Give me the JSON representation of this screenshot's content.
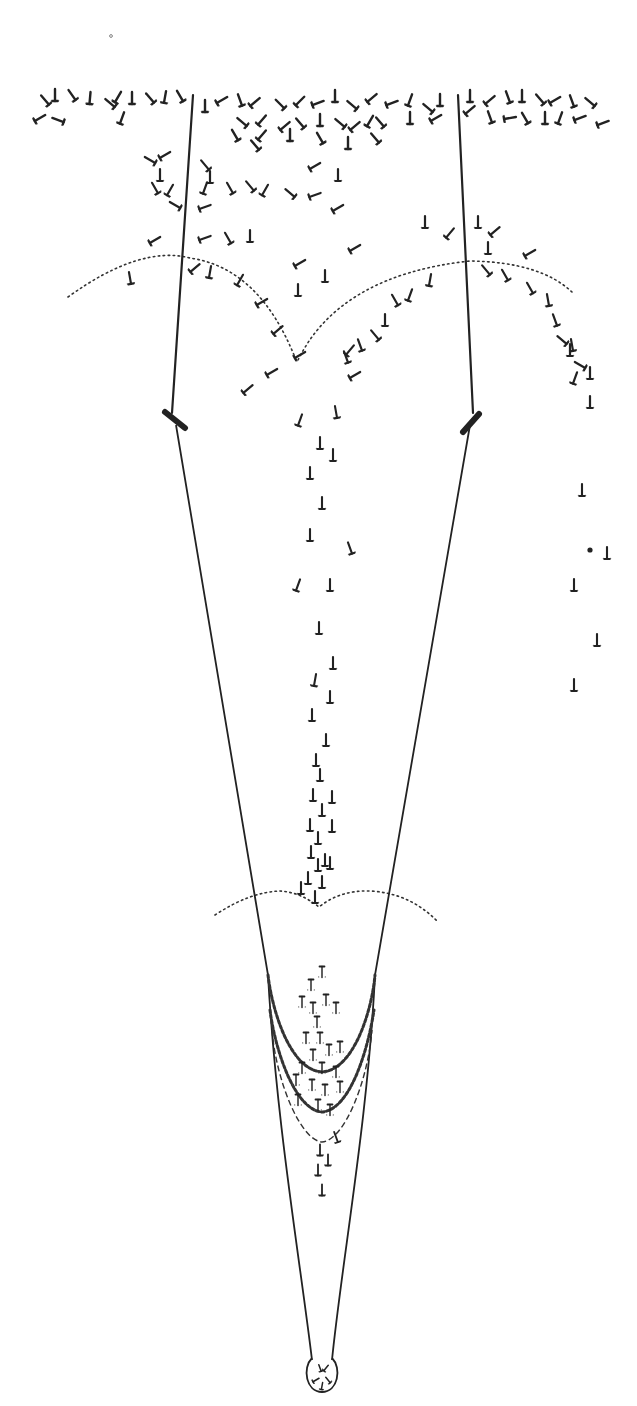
{
  "figure": {
    "type": "scientific-illustration",
    "colors": {
      "ink": "#222222",
      "background": "#ffffff"
    },
    "stray_mark": {
      "x": 111,
      "y": 36
    },
    "wires": [
      {
        "name": "left-wire",
        "from": [
          193,
          95
        ],
        "to": [
          172,
          413
        ]
      },
      {
        "name": "right-wire",
        "from": [
          458,
          95
        ],
        "to": [
          473,
          413
        ]
      }
    ],
    "clips": [
      {
        "name": "left-clip",
        "from": [
          165,
          412
        ],
        "to": [
          185,
          428
        ]
      },
      {
        "name": "right-clip",
        "from": [
          463,
          432
        ],
        "to": [
          479,
          414
        ]
      }
    ],
    "funnel": {
      "left": "M176,425 L268,975 C276,1120 300,1260 312,1360",
      "right": "M470,425 L375,975 C368,1120 342,1260 332,1360",
      "bulb": "M312,1358 C302,1368 306,1392 322,1392 C338,1392 342,1368 332,1358"
    },
    "dotted_arcs": [
      {
        "name": "upper-left-arc",
        "d": "M68,297 Q140,245 190,258 Q260,268 296,360"
      },
      {
        "name": "upper-right-arc",
        "d": "M298,360 Q340,275 470,261 Q540,262 572,292"
      },
      {
        "name": "lower-arc",
        "d": "M215,915 Q250,892 280,891 Q300,892 319,907 Q340,890 370,891 Q410,893 438,922"
      }
    ],
    "chains": [
      {
        "name": "upper-chain",
        "d": "M268,975 C272,1010 290,1070 322,1072 C354,1070 372,1010 375,975",
        "style": "chain"
      },
      {
        "name": "lower-chain",
        "d": "M270,1010 C275,1050 295,1110 322,1112 C350,1110 368,1050 374,1010",
        "style": "chain"
      },
      {
        "name": "inner-thin-line",
        "d": "M272,1030 C276,1080 300,1140 322,1142 C345,1140 368,1080 372,1030",
        "style": "chain-thin"
      }
    ],
    "particle_groups": [
      {
        "name": "top-band",
        "size": 12,
        "width": 2.4,
        "items": [
          [
            45,
            100,
            -40
          ],
          [
            55,
            95,
            0
          ],
          [
            72,
            95,
            -35
          ],
          [
            90,
            98,
            5
          ],
          [
            110,
            103,
            -50
          ],
          [
            118,
            97,
            30
          ],
          [
            132,
            98,
            0
          ],
          [
            150,
            98,
            -40
          ],
          [
            165,
            97,
            10
          ],
          [
            180,
            96,
            -30
          ],
          [
            40,
            118,
            60
          ],
          [
            58,
            120,
            -70
          ],
          [
            122,
            118,
            20
          ],
          [
            205,
            106,
            0
          ],
          [
            222,
            100,
            60
          ],
          [
            240,
            100,
            -20
          ],
          [
            255,
            102,
            50
          ],
          [
            280,
            104,
            -45
          ],
          [
            300,
            101,
            45
          ],
          [
            318,
            103,
            70
          ],
          [
            335,
            96,
            0
          ],
          [
            352,
            105,
            -50
          ],
          [
            372,
            98,
            50
          ],
          [
            392,
            103,
            70
          ],
          [
            410,
            100,
            20
          ],
          [
            428,
            108,
            -50
          ],
          [
            440,
            100,
            0
          ],
          [
            470,
            96,
            0
          ],
          [
            490,
            100,
            50
          ],
          [
            508,
            97,
            -20
          ],
          [
            522,
            96,
            0
          ],
          [
            540,
            99,
            -40
          ],
          [
            555,
            100,
            60
          ],
          [
            572,
            101,
            -20
          ],
          [
            590,
            102,
            -50
          ],
          [
            603,
            123,
            70
          ],
          [
            242,
            122,
            -50
          ],
          [
            262,
            120,
            40
          ],
          [
            285,
            126,
            50
          ],
          [
            300,
            123,
            -40
          ],
          [
            320,
            120,
            0
          ],
          [
            340,
            123,
            -50
          ],
          [
            355,
            126,
            50
          ],
          [
            370,
            121,
            30
          ],
          [
            380,
            122,
            -40
          ],
          [
            410,
            118,
            0
          ],
          [
            436,
            118,
            60
          ],
          [
            470,
            110,
            50
          ],
          [
            490,
            117,
            -20
          ],
          [
            510,
            118,
            80
          ],
          [
            525,
            118,
            -30
          ],
          [
            545,
            118,
            0
          ],
          [
            560,
            118,
            20
          ],
          [
            580,
            118,
            70
          ],
          [
            235,
            135,
            -30
          ],
          [
            262,
            135,
            40
          ],
          [
            290,
            135,
            0
          ],
          [
            320,
            138,
            -30
          ],
          [
            375,
            138,
            -40
          ],
          [
            255,
            145,
            -40
          ],
          [
            348,
            143,
            0
          ]
        ]
      },
      {
        "name": "upper-scatter",
        "size": 12,
        "width": 2.2,
        "items": [
          [
            150,
            160,
            -60
          ],
          [
            165,
            155,
            60
          ],
          [
            160,
            175,
            0
          ],
          [
            205,
            165,
            -40
          ],
          [
            210,
            177,
            0
          ],
          [
            155,
            188,
            -30
          ],
          [
            170,
            190,
            30
          ],
          [
            205,
            188,
            20
          ],
          [
            230,
            188,
            -30
          ],
          [
            250,
            186,
            -40
          ],
          [
            265,
            190,
            30
          ],
          [
            315,
            166,
            60
          ],
          [
            338,
            175,
            0
          ],
          [
            290,
            193,
            -50
          ],
          [
            315,
            195,
            70
          ],
          [
            338,
            208,
            60
          ],
          [
            175,
            205,
            -60
          ],
          [
            205,
            207,
            70
          ],
          [
            155,
            240,
            60
          ],
          [
            205,
            238,
            70
          ],
          [
            250,
            236,
            0
          ],
          [
            228,
            238,
            -30
          ],
          [
            355,
            248,
            60
          ],
          [
            425,
            222,
            0
          ],
          [
            450,
            233,
            40
          ],
          [
            478,
            222,
            0
          ],
          [
            495,
            231,
            50
          ],
          [
            488,
            248,
            0
          ],
          [
            530,
            253,
            60
          ],
          [
            130,
            278,
            -10
          ],
          [
            195,
            268,
            50
          ],
          [
            210,
            272,
            10
          ],
          [
            240,
            280,
            30
          ],
          [
            262,
            302,
            60
          ],
          [
            278,
            330,
            50
          ],
          [
            300,
            355,
            60
          ],
          [
            300,
            263,
            60
          ],
          [
            325,
            276,
            0
          ],
          [
            298,
            290,
            0
          ],
          [
            410,
            295,
            20
          ],
          [
            430,
            280,
            10
          ],
          [
            395,
            300,
            -30
          ],
          [
            385,
            320,
            0
          ],
          [
            375,
            335,
            -40
          ],
          [
            360,
            345,
            -20
          ],
          [
            350,
            350,
            40
          ],
          [
            346,
            357,
            -20
          ],
          [
            486,
            270,
            -40
          ],
          [
            505,
            275,
            -30
          ],
          [
            530,
            288,
            -30
          ],
          [
            548,
            300,
            -10
          ],
          [
            555,
            320,
            -20
          ],
          [
            562,
            340,
            -50
          ],
          [
            572,
            345,
            -10
          ],
          [
            570,
            350,
            0
          ],
          [
            580,
            365,
            -60
          ],
          [
            590,
            373,
            0
          ],
          [
            575,
            378,
            20
          ],
          [
            590,
            402,
            0
          ],
          [
            248,
            389,
            50
          ],
          [
            272,
            372,
            60
          ],
          [
            355,
            375,
            60
          ]
        ]
      },
      {
        "name": "descending-column",
        "size": 12,
        "width": 2.1,
        "items": [
          [
            300,
            420,
            20
          ],
          [
            336,
            412,
            -10
          ],
          [
            320,
            443,
            0
          ],
          [
            333,
            455,
            0
          ],
          [
            310,
            473,
            0
          ],
          [
            322,
            503,
            0
          ],
          [
            310,
            535,
            0
          ],
          [
            350,
            548,
            -20
          ],
          [
            298,
            585,
            20
          ],
          [
            330,
            585,
            0
          ],
          [
            319,
            628,
            0
          ],
          [
            333,
            663,
            0
          ],
          [
            315,
            680,
            10
          ],
          [
            330,
            697,
            0
          ],
          [
            312,
            715,
            0
          ],
          [
            326,
            740,
            0
          ],
          [
            316,
            760,
            0
          ],
          [
            320,
            775,
            0
          ],
          [
            313,
            795,
            0
          ],
          [
            332,
            797,
            0
          ],
          [
            322,
            810,
            0
          ],
          [
            310,
            825,
            0
          ],
          [
            332,
            826,
            0
          ],
          [
            318,
            838,
            0
          ],
          [
            311,
            852,
            0
          ],
          [
            325,
            860,
            0
          ],
          [
            330,
            863,
            0
          ],
          [
            318,
            865,
            0
          ],
          [
            308,
            878,
            0
          ],
          [
            322,
            882,
            0
          ],
          [
            301,
            888,
            0
          ],
          [
            315,
            897,
            0
          ]
        ]
      },
      {
        "name": "right-stream",
        "size": 12,
        "width": 2.1,
        "items": [
          [
            582,
            490,
            0
          ],
          [
            607,
            553,
            0
          ],
          [
            574,
            585,
            0
          ],
          [
            597,
            640,
            0
          ],
          [
            574,
            685,
            0
          ]
        ]
      },
      {
        "name": "trapped-in-funnel",
        "size": 11,
        "width": 1.8,
        "inverted": true,
        "items": [
          [
            322,
            972,
            0
          ],
          [
            311,
            985,
            0
          ],
          [
            326,
            1000,
            0
          ],
          [
            302,
            1002,
            0
          ],
          [
            313,
            1008,
            0
          ],
          [
            336,
            1008,
            0
          ],
          [
            317,
            1022,
            0
          ],
          [
            306,
            1038,
            0
          ],
          [
            320,
            1038,
            0
          ],
          [
            329,
            1050,
            0
          ],
          [
            340,
            1047,
            0
          ],
          [
            313,
            1055,
            0
          ],
          [
            302,
            1068,
            0
          ],
          [
            322,
            1068,
            0
          ],
          [
            336,
            1072,
            0
          ],
          [
            296,
            1080,
            0
          ],
          [
            312,
            1085,
            0
          ],
          [
            325,
            1090,
            0
          ],
          [
            340,
            1087,
            0
          ],
          [
            298,
            1100,
            0
          ],
          [
            318,
            1105,
            0
          ],
          [
            330,
            1110,
            0
          ]
        ]
      },
      {
        "name": "below-chain",
        "size": 11,
        "width": 1.8,
        "items": [
          [
            336,
            1137,
            -20
          ],
          [
            320,
            1150,
            0
          ],
          [
            328,
            1160,
            0
          ],
          [
            318,
            1170,
            0
          ],
          [
            322,
            1190,
            0
          ]
        ]
      },
      {
        "name": "in-bulb",
        "size": 7,
        "width": 1.5,
        "items": [
          [
            320,
            1368,
            -20
          ],
          [
            326,
            1368,
            40
          ],
          [
            316,
            1380,
            60
          ],
          [
            328,
            1380,
            -40
          ],
          [
            322,
            1386,
            10
          ]
        ]
      }
    ],
    "specks": [
      [
        590,
        550
      ]
    ],
    "labels": []
  }
}
